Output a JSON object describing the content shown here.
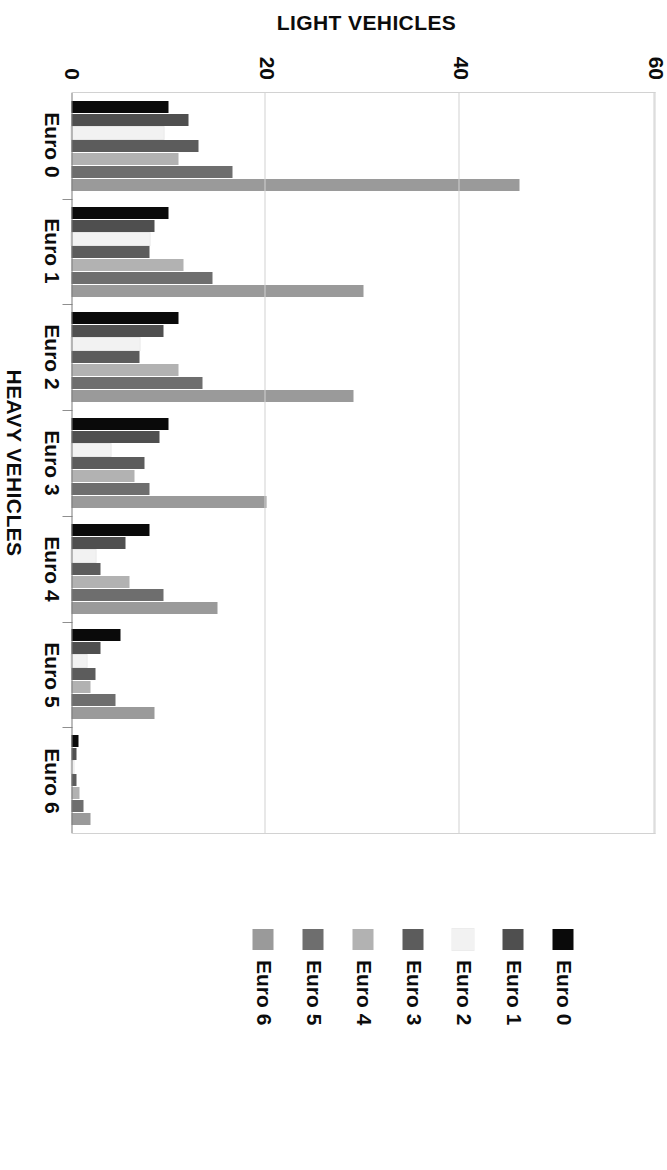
{
  "chart_data": {
    "type": "bar",
    "title": "",
    "subtitle": "",
    "xlabel": "HEAVY VEHICLES",
    "ylabel": "LIGHT VEHICLES",
    "categories": [
      "Euro 0",
      "Euro 1",
      "Euro 2",
      "Euro 3",
      "Euro 4",
      "Euro 5",
      "Euro 6"
    ],
    "ylim": [
      0,
      60
    ],
    "yticks": [
      0,
      20,
      40,
      60
    ],
    "ytick_labels": [
      "0",
      "20",
      "40",
      "60"
    ],
    "grid": "vertical-value-gridlines",
    "legend_position": "right",
    "orientation": "vertical-bars-figure-rotated-90",
    "series": [
      {
        "name": "Euro 0",
        "color": "#0a0a0a",
        "values": [
          10.0,
          10.0,
          11.0,
          10.0,
          8.0,
          5.0,
          0.7
        ]
      },
      {
        "name": "Euro 1",
        "color": "#4f4f4f",
        "values": [
          12.0,
          8.5,
          9.5,
          9.0,
          5.5,
          3.0,
          0.5
        ]
      },
      {
        "name": "Euro 2",
        "color": "#f2f2f2",
        "values": [
          9.5,
          8.0,
          7.0,
          4.0,
          2.5,
          1.5,
          0.2
        ]
      },
      {
        "name": "Euro 3",
        "color": "#5c5c5c",
        "values": [
          13.0,
          8.0,
          7.0,
          7.5,
          3.0,
          2.5,
          0.5
        ]
      },
      {
        "name": "Euro 4",
        "color": "#b2b2b2",
        "values": [
          11.0,
          11.5,
          11.0,
          6.5,
          6.0,
          2.0,
          0.8
        ]
      },
      {
        "name": "Euro 5",
        "color": "#6e6e6e",
        "values": [
          16.5,
          14.5,
          13.5,
          8.0,
          9.5,
          4.5,
          1.2
        ]
      },
      {
        "name": "Euro 6",
        "color": "#9a9a9a",
        "values": [
          46.0,
          30.0,
          29.0,
          20.0,
          15.0,
          8.5,
          2.0
        ]
      }
    ]
  },
  "legend": {
    "items": [
      {
        "label": "Euro 0",
        "color": "#0a0a0a"
      },
      {
        "label": "Euro 1",
        "color": "#4f4f4f"
      },
      {
        "label": "Euro 2",
        "color": "#f2f2f2"
      },
      {
        "label": "Euro 3",
        "color": "#5c5c5c"
      },
      {
        "label": "Euro 4",
        "color": "#b2b2b2"
      },
      {
        "label": "Euro 5",
        "color": "#6e6e6e"
      },
      {
        "label": "Euro 6",
        "color": "#9a9a9a"
      }
    ]
  }
}
